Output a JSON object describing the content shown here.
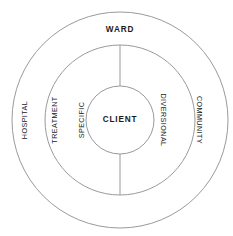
{
  "diagram": {
    "background_color": "#ffffff",
    "stroke_color": "#9a9a9a",
    "text_color": "#1a1a1a",
    "geometry": {
      "center_x": 120,
      "center_y": 120,
      "outer_radius": 108,
      "middle_radius": 75,
      "inner_radius": 34
    },
    "rings": {
      "outer": {
        "top_label": "WARD",
        "left_label": "HOSPITAL",
        "right_label": "COMMUNITY"
      },
      "middle": {
        "left_label_line1": "TREATMENT",
        "left_label_line2": "SPECIFIC",
        "right_label": "DIVERSIONAL"
      },
      "inner": {
        "label": "CLIENT"
      }
    }
  }
}
